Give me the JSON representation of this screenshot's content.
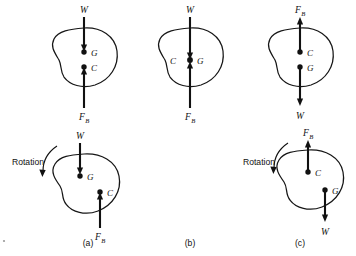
{
  "figure": {
    "background": "#ffffff",
    "ink": "#111111",
    "panel_labels": [
      {
        "text": "(a)",
        "x": 88,
        "y": 243
      },
      {
        "text": "(b)",
        "x": 190,
        "y": 243
      },
      {
        "text": "(c)",
        "x": 300,
        "y": 243
      }
    ],
    "rotation_label": "Rotation",
    "point_labels": {
      "gravity": "G",
      "buoyancy": "C"
    },
    "force_labels": {
      "weight": "W",
      "buoyant": "F",
      "buoyant_subscript": "B"
    },
    "panels": [
      {
        "id": "top-a",
        "column": "a",
        "row": "top",
        "rotated": false,
        "has_rotation": false,
        "points": [
          {
            "name": "G",
            "label": "G",
            "x": 84,
            "y": 52,
            "label_x": 91,
            "label_y": 55
          },
          {
            "name": "C",
            "label": "C",
            "x": 84,
            "y": 67,
            "label_x": 91,
            "label_y": 70
          }
        ],
        "forces": [
          {
            "name": "W",
            "label": "W",
            "direction": "down",
            "x": 84,
            "from_y": 17,
            "to_y": 49,
            "label_x": 84,
            "label_y": 12
          },
          {
            "name": "F_B",
            "label": "F",
            "subscript": "B",
            "direction": "up",
            "x": 84,
            "from_y": 108,
            "to_y": 70,
            "label_x": 84,
            "label_y": 117
          }
        ]
      },
      {
        "id": "top-b",
        "column": "b",
        "row": "top",
        "rotated": false,
        "has_rotation": false,
        "points": [
          {
            "name": "CG",
            "label": "G",
            "x": 190,
            "y": 60,
            "label_x": 197,
            "label_y": 63
          },
          {
            "name": "C",
            "label": "C",
            "x": 190,
            "y": 60,
            "label_x": 174,
            "label_y": 63
          }
        ],
        "forces": [
          {
            "name": "W",
            "label": "W",
            "direction": "down",
            "x": 190,
            "from_y": 17,
            "to_y": 56,
            "label_x": 190,
            "label_y": 12
          },
          {
            "name": "F_B",
            "label": "F",
            "subscript": "B",
            "direction": "up",
            "x": 190,
            "from_y": 108,
            "to_y": 65,
            "label_x": 190,
            "label_y": 117
          }
        ]
      },
      {
        "id": "top-c",
        "column": "c",
        "row": "top",
        "rotated": false,
        "has_rotation": false,
        "points": [
          {
            "name": "C",
            "label": "C",
            "x": 300,
            "y": 52,
            "label_x": 307,
            "label_y": 55
          },
          {
            "name": "G",
            "label": "G",
            "x": 300,
            "y": 67,
            "label_x": 307,
            "label_y": 70
          }
        ],
        "forces": [
          {
            "name": "F_B",
            "label": "F",
            "subscript": "B",
            "direction": "up",
            "x": 300,
            "from_y": 52,
            "to_y": 17,
            "label_x": 300,
            "label_y": 12
          },
          {
            "name": "W",
            "label": "W",
            "direction": "down",
            "x": 300,
            "from_y": 67,
            "to_y": 105,
            "label_x": 300,
            "label_y": 117
          }
        ]
      },
      {
        "id": "bottom-a",
        "column": "a",
        "row": "bottom",
        "rotated": true,
        "has_rotation": true,
        "rotation_text_x": 12,
        "rotation_text_y": 164,
        "points": [
          {
            "name": "G",
            "label": "G",
            "x": 80,
            "y": 176,
            "label_x": 87,
            "label_y": 179
          },
          {
            "name": "C",
            "label": "C",
            "x": 100,
            "y": 192,
            "label_x": 107,
            "label_y": 195
          }
        ],
        "forces": [
          {
            "name": "W",
            "label": "W",
            "direction": "down",
            "x": 80,
            "from_y": 143,
            "to_y": 173,
            "label_x": 80,
            "label_y": 138
          },
          {
            "name": "F_B",
            "label": "F",
            "subscript": "B",
            "direction": "up",
            "x": 100,
            "from_y": 228,
            "to_y": 195,
            "label_x": 100,
            "label_y": 238
          }
        ]
      },
      {
        "id": "bottom-c",
        "column": "c",
        "row": "bottom",
        "rotated": true,
        "has_rotation": true,
        "rotation_text_x": 243,
        "rotation_text_y": 164,
        "points": [
          {
            "name": "C",
            "label": "C",
            "x": 308,
            "y": 172,
            "label_x": 315,
            "label_y": 175
          },
          {
            "name": "G",
            "label": "G",
            "x": 325,
            "y": 190,
            "label_x": 332,
            "label_y": 193
          }
        ],
        "forces": [
          {
            "name": "F_B",
            "label": "F",
            "subscript": "B",
            "direction": "up",
            "x": 308,
            "from_y": 172,
            "to_y": 140,
            "label_x": 308,
            "label_y": 135
          },
          {
            "name": "W",
            "label": "W",
            "direction": "down",
            "x": 325,
            "from_y": 190,
            "to_y": 222,
            "label_x": 325,
            "label_y": 233
          }
        ]
      }
    ]
  }
}
